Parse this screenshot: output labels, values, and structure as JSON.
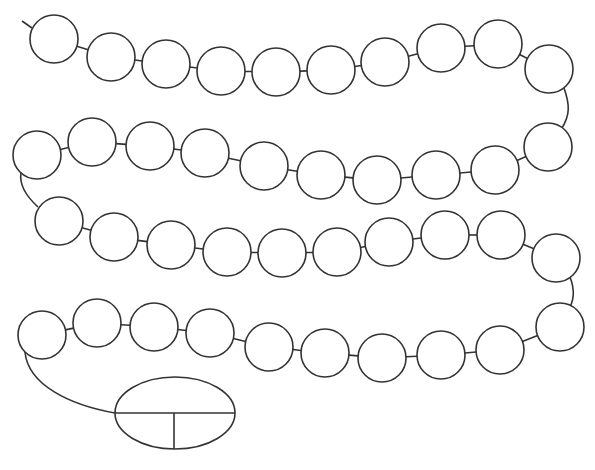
{
  "diagram": {
    "title": "",
    "stroke_color": "#333333",
    "fill_color": "#ffffff",
    "bead_radius": 24,
    "lead_in": {
      "x1": 22,
      "y1": 21,
      "x2": 32,
      "y2": 28
    },
    "beads": [
      {
        "id": 1,
        "cx": 54,
        "cy": 39
      },
      {
        "id": 2,
        "cx": 111,
        "cy": 57
      },
      {
        "id": 3,
        "cx": 166,
        "cy": 64
      },
      {
        "id": 4,
        "cx": 221,
        "cy": 71
      },
      {
        "id": 5,
        "cx": 276,
        "cy": 72
      },
      {
        "id": 6,
        "cx": 331,
        "cy": 70
      },
      {
        "id": 7,
        "cx": 385,
        "cy": 62
      },
      {
        "id": 8,
        "cx": 441,
        "cy": 48
      },
      {
        "id": 9,
        "cx": 498,
        "cy": 44
      },
      {
        "id": 10,
        "cx": 549,
        "cy": 69
      },
      {
        "id": 11,
        "cx": 548,
        "cy": 147
      },
      {
        "id": 12,
        "cx": 495,
        "cy": 170
      },
      {
        "id": 13,
        "cx": 436,
        "cy": 175
      },
      {
        "id": 14,
        "cx": 377,
        "cy": 180
      },
      {
        "id": 15,
        "cx": 321,
        "cy": 175
      },
      {
        "id": 16,
        "cx": 264,
        "cy": 166
      },
      {
        "id": 17,
        "cx": 205,
        "cy": 153
      },
      {
        "id": 18,
        "cx": 150,
        "cy": 146
      },
      {
        "id": 19,
        "cx": 92,
        "cy": 142
      },
      {
        "id": 20,
        "cx": 37,
        "cy": 155
      },
      {
        "id": 21,
        "cx": 59,
        "cy": 221
      },
      {
        "id": 22,
        "cx": 114,
        "cy": 237
      },
      {
        "id": 23,
        "cx": 171,
        "cy": 245
      },
      {
        "id": 24,
        "cx": 227,
        "cy": 252
      },
      {
        "id": 25,
        "cx": 282,
        "cy": 253
      },
      {
        "id": 26,
        "cx": 337,
        "cy": 252
      },
      {
        "id": 27,
        "cx": 389,
        "cy": 242
      },
      {
        "id": 28,
        "cx": 445,
        "cy": 235
      },
      {
        "id": 29,
        "cx": 501,
        "cy": 235
      },
      {
        "id": 30,
        "cx": 556,
        "cy": 258
      },
      {
        "id": 31,
        "cx": 560,
        "cy": 327
      },
      {
        "id": 32,
        "cx": 500,
        "cy": 350
      },
      {
        "id": 33,
        "cx": 441,
        "cy": 355
      },
      {
        "id": 34,
        "cx": 382,
        "cy": 358
      },
      {
        "id": 35,
        "cx": 325,
        "cy": 353
      },
      {
        "id": 36,
        "cx": 269,
        "cy": 347
      },
      {
        "id": 37,
        "cx": 210,
        "cy": 333
      },
      {
        "id": 38,
        "cx": 154,
        "cy": 327
      },
      {
        "id": 39,
        "cx": 97,
        "cy": 323
      },
      {
        "id": 40,
        "cx": 42,
        "cy": 335
      }
    ],
    "turns": [
      {
        "from": 10,
        "to": 11,
        "path": "M 564 88 C 570 105, 570 115, 562 128"
      },
      {
        "from": 20,
        "to": 21,
        "path": "M 21 173 C 19 185, 26 196, 38 207"
      },
      {
        "from": 30,
        "to": 31,
        "path": "M 570 277 C 575 290, 575 300, 568 310"
      },
      {
        "from": 40,
        "to": "oval",
        "path": "M 25 352 C 28 385, 70 405, 115 413"
      }
    ],
    "part_whole_oval": {
      "cx": 175,
      "cy": 413,
      "rx": 60,
      "ry": 36,
      "whole_label": "",
      "part_labels": [
        "",
        ""
      ],
      "divider_y": 413,
      "split_x": 174
    }
  }
}
